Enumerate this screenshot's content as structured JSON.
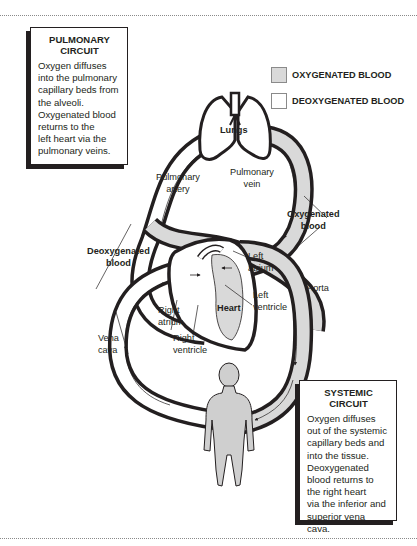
{
  "pulmonary_box": {
    "title_line1": "PULMONARY",
    "title_line2": "CIRCUIT",
    "body": [
      "Oxygen diffuses",
      "into the pulmonary",
      "capillary beds from",
      "the alveoli.",
      "Oxygenated blood",
      "returns to the",
      "left heart via the",
      "pulmonary veins."
    ]
  },
  "systemic_box": {
    "title_line1": "SYSTEMIC",
    "title_line2": "CIRCUIT",
    "body": [
      "Oxygen diffuses",
      "out of the systemic",
      "capillary beds and",
      "into the tissue.",
      "Deoxygenated",
      "blood returns to",
      "the right heart",
      "via the inferior and",
      "superior vena cava."
    ]
  },
  "legend": [
    {
      "label": "OXYGENATED BLOOD",
      "color": "#d9d9d9"
    },
    {
      "label": "DEOXYGENATED BLOOD",
      "color": "#ffffff"
    }
  ],
  "labels": {
    "lungs": "Lungs",
    "pulmonary_artery_1": "Pulmonary",
    "pulmonary_artery_2": "artery",
    "pulmonary_vein_1": "Pulmonary",
    "pulmonary_vein_2": "vein",
    "oxygenated_1": "Oxygenated",
    "oxygenated_2": "blood",
    "deoxygenated_1": "Deoxygenated",
    "deoxygenated_2": "blood",
    "left_atrium_1": "Left",
    "left_atrium_2": "atrium",
    "left_ventricle_1": "Left",
    "left_ventricle_2": "ventricle",
    "aorta": "Aorta",
    "heart": "Heart",
    "right_atrium_1": "Right",
    "right_atrium_2": "atrium",
    "right_ventricle_1": "Right",
    "right_ventricle_2": "ventricle",
    "vena_cava_1": "Vena",
    "vena_cava_2": "cava"
  },
  "colors": {
    "outline": "#231f20",
    "oxygenated_fill": "#d9d9d9",
    "deoxygenated_fill": "#ffffff",
    "body_fill": "#cfcfcf"
  }
}
